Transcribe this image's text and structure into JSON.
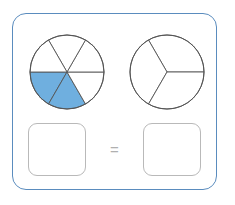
{
  "activity": {
    "type": "fraction-equivalence-pie-chart",
    "frame_color": "#5a8cbe",
    "background_color": "#ffffff"
  },
  "figures": {
    "left_pie": {
      "name": "six-sector-pie",
      "center_x": 67,
      "center_y": 72,
      "radius": 37,
      "total_sectors": 6,
      "shaded_sectors": 2,
      "shaded_indices": [
        3,
        4
      ],
      "fill_color": "#6fafdf",
      "stroke_color": "#555555",
      "start_angle_deg": 0,
      "sector_angle_deg": 60
    },
    "right_pie": {
      "name": "three-sector-pie",
      "center_x": 167,
      "center_y": 72,
      "radius": 37,
      "total_sectors": 3,
      "shaded_sectors": 0,
      "shaded_indices": [],
      "fill_color": "#ffffff",
      "stroke_color": "#555555",
      "start_angle_deg": 0,
      "sector_angle_deg": 120
    }
  },
  "answer_row": {
    "left_box": {
      "name": "left-answer-box",
      "value": "",
      "placeholder": ""
    },
    "equals_label": "=",
    "right_box": {
      "name": "right-answer-box",
      "value": "",
      "placeholder": ""
    },
    "box_border_color": "#b9b9b9",
    "equals_color": "#b0b0b0"
  }
}
